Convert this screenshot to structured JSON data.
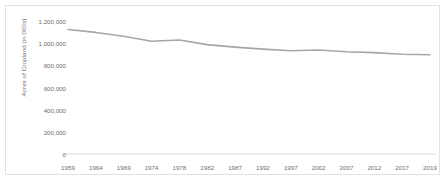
{
  "chart_data": {
    "type": "line",
    "title": "",
    "xlabel": "",
    "ylabel": "Acres of Cropland (in 000s)",
    "categories": [
      "1959",
      "1964",
      "1969",
      "1974",
      "1978",
      "1982",
      "1987",
      "1992",
      "1997",
      "2002",
      "2007",
      "2012",
      "2017",
      "2019"
    ],
    "values": [
      1123000,
      1097000,
      1063000,
      1017000,
      1029000,
      987000,
      964000,
      946000,
      932000,
      938000,
      922000,
      915000,
      900000,
      896000
    ],
    "ylim": [
      0,
      1200000
    ],
    "ytick_step": 200000,
    "ytick_labels": [
      "0",
      "200,000",
      "400,000",
      "600,000",
      "800,000",
      "1,000,000",
      "1,200,000"
    ],
    "ytick_values": [
      0,
      200000,
      400000,
      600000,
      800000,
      1000000,
      1200000
    ],
    "grid": false,
    "legend": false,
    "series": [
      {
        "name": "Acres of Cropland",
        "color": "#a6a6a6",
        "values": [
          1123000,
          1097000,
          1063000,
          1017000,
          1029000,
          987000,
          964000,
          946000,
          932000,
          938000,
          922000,
          915000,
          900000,
          896000
        ]
      }
    ],
    "axis_color": "#d9d9d9",
    "text_color": "#6e6e6e",
    "border_color": "#e2e2e2",
    "background": "#ffffff"
  }
}
